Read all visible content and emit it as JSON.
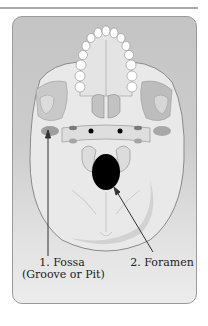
{
  "diagram": {
    "labels": [
      {
        "id": 1,
        "line1": "1. Fossa",
        "line2": "(Groove or Pit)"
      },
      {
        "id": 2,
        "line1": "2. Foramen"
      }
    ],
    "colors": {
      "card_background": "#cdcdcd",
      "bone": "#ececec",
      "outline": "#8a8a8a",
      "foramen": "#000000",
      "arrow": "#333333"
    }
  }
}
